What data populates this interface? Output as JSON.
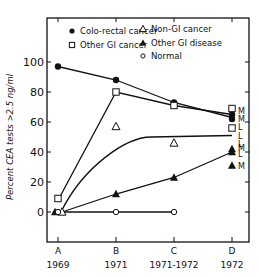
{
  "chart_data": {
    "type": "line",
    "title": "",
    "xlabel": "",
    "ylabel": "Percent CEA tests >2.5 ng/ml",
    "ylim": [
      -20,
      120
    ],
    "yticks": [
      0,
      20,
      40,
      60,
      80,
      100
    ],
    "categories": [
      "A",
      "B",
      "C",
      "D"
    ],
    "category_years": [
      "1969",
      "1971",
      "1971-1972",
      "1972"
    ],
    "legend_position": "top-inside",
    "grid": false,
    "legend": [
      {
        "name": "Colo-rectal cancer",
        "marker": "filled-circle"
      },
      {
        "name": "Other GI cancer",
        "marker": "open-square"
      },
      {
        "name": "Non-GI cancer",
        "marker": "open-triangle"
      },
      {
        "name": "Other GI disease",
        "marker": "filled-triangle"
      },
      {
        "name": "Normal",
        "marker": "open-circle"
      }
    ],
    "series": [
      {
        "name": "Colo-rectal cancer",
        "marker": "filled-circle",
        "values": [
          97,
          88,
          73,
          63
        ],
        "d_labels": [
          "M",
          "L"
        ],
        "d_values": [
          65,
          62
        ]
      },
      {
        "name": "Other GI cancer",
        "marker": "open-square",
        "values": [
          9,
          80,
          71,
          69
        ],
        "d_labels": [
          "M",
          "L"
        ],
        "d_values": [
          69,
          56
        ]
      },
      {
        "name": "Non-GI cancer",
        "marker": "open-triangle",
        "values": [
          0,
          57,
          46,
          null
        ]
      },
      {
        "name": "Other GI disease",
        "marker": "filled-triangle",
        "values": [
          0,
          12,
          23,
          40
        ],
        "d_labels": [
          "M",
          "L",
          "M"
        ],
        "d_values": [
          42,
          40,
          31
        ]
      },
      {
        "name": "Normal",
        "marker": "open-circle",
        "values": [
          0,
          0,
          0,
          null
        ]
      }
    ],
    "curves": [
      {
        "name": "Non-GI cancer fitted curve",
        "description": "smooth rise from A to plateau ~50 at D"
      }
    ],
    "annotations": [
      "M",
      "M",
      "L",
      "L",
      "L",
      "M",
      "L",
      "M"
    ]
  }
}
